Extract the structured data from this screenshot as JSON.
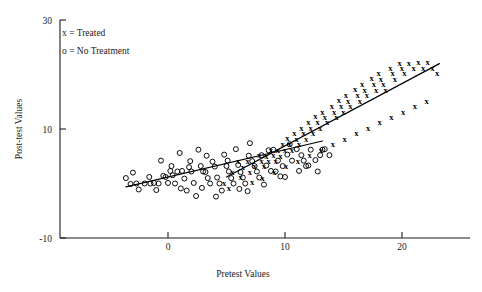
{
  "chart_data": {
    "type": "scatter",
    "title": "",
    "xlabel": "Pretest Values",
    "ylabel": "Post-test Values",
    "xlim": [
      -4,
      24.5
    ],
    "ylim": [
      -10,
      30
    ],
    "xticks": [
      0,
      10,
      20
    ],
    "xticklabels": [
      "0",
      "10",
      "20"
    ],
    "yticks": [
      -10,
      10,
      30
    ],
    "yticklabels": [
      "-10",
      "10",
      "30"
    ],
    "grid": false,
    "legend_position": "upper-left-inside",
    "legend": [
      {
        "marker": "x",
        "separator": "=",
        "label": "Treated"
      },
      {
        "marker": "o",
        "separator": "=",
        "label": "No Treatment"
      }
    ],
    "series": [
      {
        "name": "No Treatment",
        "marker": "o",
        "points": [
          [
            -3.6,
            1.0
          ],
          [
            -3.2,
            -0.1
          ],
          [
            -3.0,
            2.0
          ],
          [
            -2.7,
            0.0
          ],
          [
            -2.5,
            -1.1
          ],
          [
            -2.0,
            0.0
          ],
          [
            -1.6,
            1.2
          ],
          [
            -1.5,
            0.0
          ],
          [
            -1.2,
            0.1
          ],
          [
            -1.0,
            -1.2
          ],
          [
            -0.8,
            0.0
          ],
          [
            -0.6,
            4.2
          ],
          [
            -0.4,
            1.4
          ],
          [
            -0.2,
            1.2
          ],
          [
            0.0,
            0.1
          ],
          [
            0.2,
            2.3
          ],
          [
            0.4,
            1.5
          ],
          [
            0.6,
            0.0
          ],
          [
            0.8,
            2.2
          ],
          [
            1.0,
            5.6
          ],
          [
            1.2,
            2.3
          ],
          [
            1.4,
            0.9
          ],
          [
            1.6,
            -1.3
          ],
          [
            1.8,
            3.0
          ],
          [
            2.0,
            2.2
          ],
          [
            2.2,
            0.1
          ],
          [
            2.4,
            -2.3
          ],
          [
            2.6,
            6.2
          ],
          [
            2.8,
            3.2
          ],
          [
            3.0,
            2.2
          ],
          [
            3.2,
            2.1
          ],
          [
            3.4,
            1.0
          ],
          [
            3.6,
            0.0
          ],
          [
            3.8,
            4.0
          ],
          [
            4.0,
            3.1
          ],
          [
            4.2,
            1.1
          ],
          [
            4.4,
            0.0
          ],
          [
            4.6,
            -1.3
          ],
          [
            4.8,
            5.3
          ],
          [
            5.0,
            3.2
          ],
          [
            5.2,
            2.2
          ],
          [
            5.4,
            1.0
          ],
          [
            5.6,
            0.0
          ],
          [
            5.8,
            6.3
          ],
          [
            6.0,
            3.4
          ],
          [
            6.2,
            2.1
          ],
          [
            6.4,
            1.1
          ],
          [
            6.6,
            0.0
          ],
          [
            6.8,
            -1.4
          ],
          [
            7.0,
            7.4
          ],
          [
            7.2,
            4.1
          ],
          [
            7.4,
            3.2
          ],
          [
            7.6,
            2.2
          ],
          [
            7.8,
            1.1
          ],
          [
            8.0,
            5.2
          ],
          [
            8.4,
            3.3
          ],
          [
            8.8,
            2.3
          ],
          [
            9.0,
            6.2
          ],
          [
            9.4,
            4.2
          ],
          [
            9.8,
            3.2
          ],
          [
            10.2,
            5.3
          ],
          [
            10.6,
            4.2
          ],
          [
            11.0,
            6.3
          ],
          [
            11.4,
            5.2
          ],
          [
            11.8,
            3.2
          ],
          [
            12.2,
            6.2
          ],
          [
            12.6,
            4.3
          ],
          [
            13.0,
            5.2
          ],
          [
            13.4,
            6.3
          ],
          [
            13.8,
            5.2
          ],
          [
            1.1,
            -0.9
          ],
          [
            2.9,
            -0.8
          ],
          [
            4.1,
            -2.4
          ],
          [
            6.1,
            -1.0
          ],
          [
            8.2,
            -0.2
          ],
          [
            9.2,
            2.2
          ],
          [
            10.0,
            1.2
          ],
          [
            11.2,
            2.3
          ],
          [
            12.0,
            3.3
          ],
          [
            12.8,
            2.2
          ],
          [
            0.3,
            3.2
          ],
          [
            1.9,
            4.1
          ],
          [
            3.3,
            5.1
          ],
          [
            5.1,
            4.2
          ],
          [
            6.9,
            5.1
          ],
          [
            8.6,
            6.1
          ],
          [
            10.4,
            7.2
          ],
          [
            13.2,
            6.2
          ],
          [
            9.6,
            1.3
          ],
          [
            11.6,
            4.2
          ]
        ],
        "fit_line": {
          "x0": -3.6,
          "y0": -0.6,
          "x1": 13.2,
          "y1": 7.8
        }
      },
      {
        "name": "Treated",
        "marker": "x",
        "points": [
          [
            6.0,
            4.2
          ],
          [
            6.4,
            3.1
          ],
          [
            6.8,
            4.1
          ],
          [
            7.0,
            2.2
          ],
          [
            7.4,
            3.2
          ],
          [
            7.8,
            5.2
          ],
          [
            8.0,
            4.2
          ],
          [
            8.2,
            3.2
          ],
          [
            8.4,
            5.1
          ],
          [
            8.6,
            4.1
          ],
          [
            8.8,
            6.2
          ],
          [
            9.0,
            5.2
          ],
          [
            9.2,
            4.2
          ],
          [
            9.4,
            6.1
          ],
          [
            9.6,
            5.1
          ],
          [
            9.8,
            7.2
          ],
          [
            10.0,
            6.2
          ],
          [
            10.2,
            8.3
          ],
          [
            10.4,
            7.2
          ],
          [
            10.6,
            6.2
          ],
          [
            10.8,
            9.2
          ],
          [
            11.0,
            8.2
          ],
          [
            11.2,
            7.2
          ],
          [
            11.4,
            10.2
          ],
          [
            11.6,
            9.2
          ],
          [
            11.8,
            8.2
          ],
          [
            12.0,
            11.2
          ],
          [
            12.2,
            10.2
          ],
          [
            12.4,
            9.2
          ],
          [
            12.6,
            12.3
          ],
          [
            12.8,
            11.2
          ],
          [
            13.0,
            10.2
          ],
          [
            13.2,
            13.2
          ],
          [
            13.4,
            12.2
          ],
          [
            13.6,
            11.2
          ],
          [
            14.0,
            14.2
          ],
          [
            14.2,
            13.2
          ],
          [
            14.4,
            12.2
          ],
          [
            14.6,
            15.3
          ],
          [
            14.8,
            14.2
          ],
          [
            15.0,
            13.2
          ],
          [
            15.2,
            16.2
          ],
          [
            15.4,
            15.2
          ],
          [
            15.6,
            14.2
          ],
          [
            16.0,
            17.3
          ],
          [
            16.2,
            16.2
          ],
          [
            16.4,
            15.2
          ],
          [
            16.6,
            18.2
          ],
          [
            16.8,
            17.2
          ],
          [
            17.0,
            16.2
          ],
          [
            17.4,
            19.3
          ],
          [
            17.6,
            18.2
          ],
          [
            17.8,
            17.2
          ],
          [
            18.0,
            20.3
          ],
          [
            18.2,
            19.2
          ],
          [
            18.4,
            18.2
          ],
          [
            18.6,
            17.2
          ],
          [
            19.0,
            21.2
          ],
          [
            19.2,
            20.2
          ],
          [
            19.4,
            19.2
          ],
          [
            19.8,
            22.2
          ],
          [
            20.0,
            21.2
          ],
          [
            20.2,
            20.2
          ],
          [
            20.6,
            22.2
          ],
          [
            21.0,
            21.2
          ],
          [
            21.4,
            22.3
          ],
          [
            21.8,
            21.2
          ],
          [
            22.2,
            22.3
          ],
          [
            22.6,
            21.2
          ],
          [
            23.0,
            20.2
          ],
          [
            5.5,
            2.2
          ],
          [
            6.2,
            1.2
          ],
          [
            7.2,
            0.2
          ],
          [
            8.1,
            1.1
          ],
          [
            9.1,
            2.1
          ],
          [
            10.1,
            3.2
          ],
          [
            11.1,
            4.2
          ],
          [
            12.1,
            5.2
          ],
          [
            13.1,
            6.2
          ],
          [
            14.1,
            7.2
          ],
          [
            15.1,
            8.2
          ],
          [
            16.1,
            9.2
          ],
          [
            17.1,
            10.2
          ],
          [
            18.1,
            11.2
          ],
          [
            19.1,
            12.2
          ],
          [
            20.1,
            13.2
          ],
          [
            21.1,
            14.2
          ],
          [
            22.1,
            15.2
          ],
          [
            4.8,
            0.1
          ],
          [
            5.2,
            -0.9
          ]
        ],
        "fit_line": {
          "x0": 5.0,
          "y0": 1.2,
          "x1": 23.2,
          "y1": 22.0
        }
      }
    ]
  },
  "axes": {
    "x_title": "Pretest Values",
    "y_title": "Post-test Values"
  }
}
